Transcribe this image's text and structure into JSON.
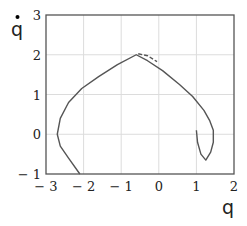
{
  "chart_data": {
    "type": "line",
    "title": "",
    "xlabel": "q",
    "ylabel": "q̇",
    "xlim": [
      -3,
      2
    ],
    "ylim": [
      -1,
      3
    ],
    "xticks": [
      "− 3",
      "− 2",
      "− 1",
      "0",
      "1",
      "2"
    ],
    "yticks": [
      "− 1",
      "0",
      "1",
      "2",
      "3"
    ],
    "grid": true,
    "legend": null,
    "series": [
      {
        "name": "trajectory (solid)",
        "style": "solid",
        "x": [
          -2.1,
          -2.4,
          -2.62,
          -2.7,
          -2.62,
          -2.4,
          -2.05,
          -1.6,
          -1.1,
          -0.6,
          -0.3,
          0.1,
          0.55,
          0.9,
          1.2,
          1.35,
          1.45,
          1.45,
          1.38,
          1.25,
          1.12,
          1.03,
          1.0
        ],
        "y": [
          -1.0,
          -0.6,
          -0.3,
          0.0,
          0.4,
          0.8,
          1.15,
          1.45,
          1.75,
          2.0,
          1.85,
          1.6,
          1.25,
          0.95,
          0.6,
          0.35,
          0.1,
          -0.2,
          -0.45,
          -0.65,
          -0.5,
          -0.2,
          0.1
        ]
      },
      {
        "name": "trajectory (dashed)",
        "style": "dashed",
        "x": [
          -0.6,
          -0.35,
          -0.1
        ],
        "y": [
          2.0,
          1.95,
          1.8
        ]
      }
    ]
  }
}
